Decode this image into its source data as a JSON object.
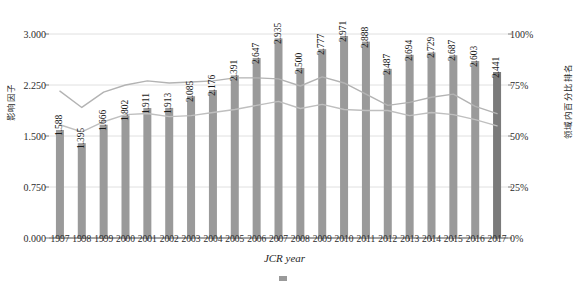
{
  "figure": {
    "xaxis_caption": "JCR year",
    "caption_note": "",
    "left_axis_title": "影响因子",
    "right_axis_title": "领域内百分比排名"
  },
  "chart_data": {
    "type": "bar",
    "title": "",
    "xlabel": "JCR year",
    "ylabel": "影响因子",
    "y2label": "领域内百分比排名",
    "grid": true,
    "legend_position": "bottom",
    "categories": [
      "1997",
      "1998",
      "1999",
      "2000",
      "2001",
      "2002",
      "2003",
      "2004",
      "2005",
      "2006",
      "2007",
      "2008",
      "2009",
      "2010",
      "2011",
      "2012",
      "2013",
      "2014",
      "2015",
      "2016",
      "2017"
    ],
    "values": [
      1.588,
      1.395,
      1.666,
      1.802,
      1.911,
      1.913,
      2.085,
      2.176,
      2.391,
      2.647,
      2.935,
      2.5,
      2.777,
      2.971,
      2.888,
      2.487,
      2.694,
      2.729,
      2.687,
      2.603,
      2.441
    ],
    "value_labels": [
      "1.588",
      "1.395",
      "1.666",
      "1.802",
      "1.911",
      "1.913",
      "2.085",
      "2.176",
      "2.391",
      "2.647",
      "2.935",
      "2.500",
      "2.777",
      "2.971",
      "2.888",
      "2.487",
      "2.694",
      "2.729",
      "2.687",
      "2.603",
      "2.441"
    ],
    "ylim": [
      0,
      3.0
    ],
    "yticks": [
      0.0,
      0.75,
      1.5,
      2.25,
      3.0
    ],
    "ytick_labels": [
      "0.000",
      "0.750",
      "1.500",
      "2.250",
      "3.000"
    ],
    "y2lim": [
      0,
      100
    ],
    "y2ticks": [
      0,
      25,
      50,
      75,
      100
    ],
    "y2tick_labels": [
      "0%",
      "25%",
      "50%",
      "75%",
      "100%"
    ],
    "bar_color": "#9a9a9a",
    "bar_color_highlight": "#7a7a7a",
    "highlight_index": 20,
    "series": [
      {
        "name": "percentile-series-upper",
        "axis": "right",
        "color": "#b3b3b3",
        "values": [
          72.0,
          64.0,
          71.5,
          75.0,
          77.0,
          76.0,
          76.5,
          77.0,
          78.5,
          78.5,
          78.0,
          74.5,
          79.0,
          76.0,
          70.5,
          65.0,
          66.5,
          69.0,
          70.5,
          64.5,
          61.0
        ]
      },
      {
        "name": "percentile-series-lower",
        "axis": "right",
        "color": "#bfbfbf",
        "values": [
          55.5,
          52.0,
          57.0,
          60.5,
          61.0,
          59.5,
          60.0,
          61.5,
          63.0,
          65.0,
          67.0,
          63.5,
          65.5,
          63.0,
          62.5,
          62.5,
          60.0,
          61.5,
          60.5,
          58.0,
          55.0
        ]
      }
    ]
  }
}
